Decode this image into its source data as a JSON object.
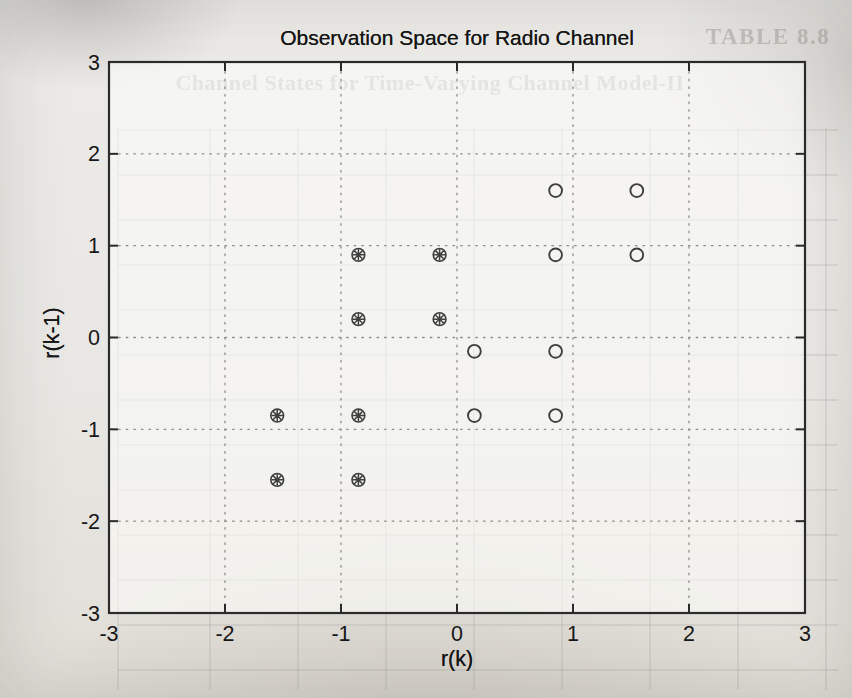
{
  "ghost": {
    "heading": "TABLE 8.8",
    "caption": "Channel States for Time-Varying Channel Model-II"
  },
  "chart_data": {
    "type": "scatter",
    "title": "Observation Space for Radio Channel",
    "xlabel": "r(k)",
    "ylabel": "r(k-1)",
    "xlim": [
      -3,
      3
    ],
    "ylim": [
      -3,
      3
    ],
    "xticks": [
      -3,
      -2,
      -1,
      0,
      1,
      2,
      3
    ],
    "yticks": [
      -3,
      -2,
      -1,
      0,
      1,
      2,
      3
    ],
    "grid": "dotted",
    "legend": "none",
    "series": [
      {
        "name": "state-positive-circles",
        "marker": "circle",
        "points": [
          [
            0.85,
            1.6
          ],
          [
            1.55,
            1.6
          ],
          [
            0.85,
            0.9
          ],
          [
            1.55,
            0.9
          ],
          [
            0.15,
            -0.15
          ],
          [
            0.85,
            -0.15
          ],
          [
            0.15,
            -0.85
          ],
          [
            0.85,
            -0.85
          ]
        ]
      },
      {
        "name": "state-negative-asterisks",
        "marker": "circled-asterisk",
        "points": [
          [
            -0.85,
            0.9
          ],
          [
            -0.15,
            0.9
          ],
          [
            -0.85,
            0.2
          ],
          [
            -0.15,
            0.2
          ],
          [
            -1.55,
            -0.85
          ],
          [
            -0.85,
            -0.85
          ],
          [
            -1.55,
            -1.55
          ],
          [
            -0.85,
            -1.55
          ]
        ]
      }
    ],
    "colors": {
      "axis": "#2b2b2b",
      "grid_dots": "#8e8e89",
      "marker": "#3f3f3f",
      "text": "#171717",
      "plot_fill": "rgba(252,251,248,0.60)",
      "ghost_line": "#95938d"
    }
  }
}
